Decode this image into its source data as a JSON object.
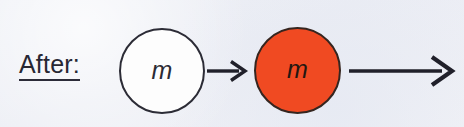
{
  "figure": {
    "background_color": "#edeff5",
    "label": {
      "text": "After:",
      "color": "#272733",
      "underlined": true
    },
    "objects": [
      {
        "name": "white-mass-circle",
        "shape": "circle",
        "fill_color": "#fdfdfd",
        "stroke_color": "#2c2c36",
        "label": "m"
      },
      {
        "name": "orange-mass-circle",
        "shape": "circle",
        "fill_color": "#f04a22",
        "stroke_color": "#35251f",
        "label": "m"
      }
    ],
    "arrows": [
      {
        "name": "short-arrow",
        "direction": "right",
        "length": "short",
        "color": "#20202a"
      },
      {
        "name": "long-arrow",
        "direction": "right",
        "length": "long",
        "color": "#20202a"
      }
    ]
  }
}
